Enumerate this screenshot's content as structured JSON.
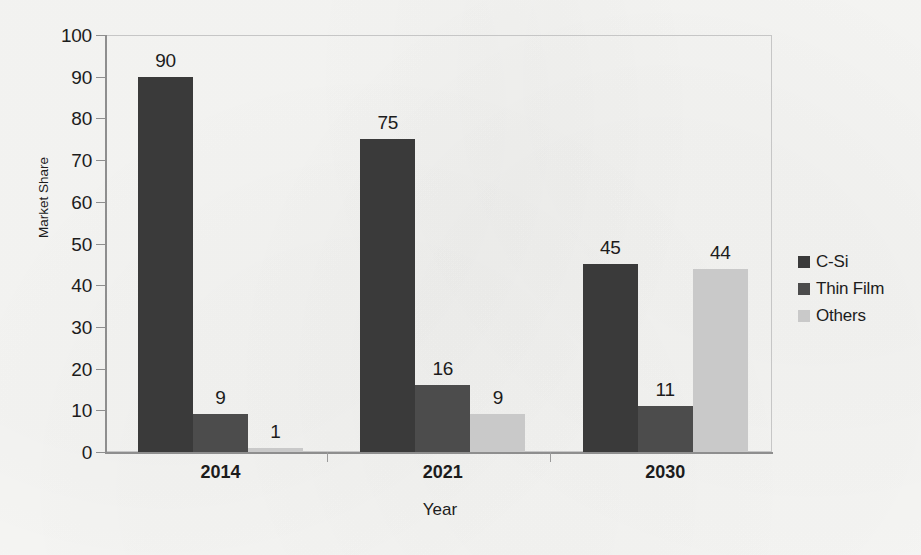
{
  "chart_data": {
    "type": "bar",
    "title": "",
    "xlabel": "Year",
    "ylabel": "Market Share",
    "categories": [
      "2014",
      "2021",
      "2030"
    ],
    "series": [
      {
        "name": "C-Si",
        "values": [
          90,
          75,
          45
        ],
        "color": "#3a3a3a"
      },
      {
        "name": "Thin Film",
        "values": [
          9,
          16,
          11
        ],
        "color": "#4c4c4c"
      },
      {
        "name": "Others",
        "values": [
          1,
          9,
          44
        ],
        "color": "#c9c9c9"
      }
    ],
    "ylim": [
      0,
      100
    ],
    "ytick_step": 10,
    "yticks": [
      "0",
      "10",
      "20",
      "30",
      "40",
      "50",
      "60",
      "70",
      "80",
      "90",
      "100"
    ],
    "grid": false,
    "legend_position": "right",
    "data_labels": true
  },
  "legend": {
    "items": [
      {
        "label": "C-Si"
      },
      {
        "label": "Thin Film"
      },
      {
        "label": "Others"
      }
    ]
  }
}
